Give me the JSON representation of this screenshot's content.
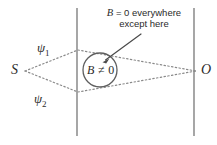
{
  "figure": {
    "kind": "aharonov-bohm-two-slit-diagram",
    "background_color": "#ffffff",
    "stroke_color": "#6e6e6e",
    "text_color": "#2b2b2b",
    "annotation": {
      "line1_symbol": "B",
      "line1_rest": " = 0 everywhere",
      "line2": "except here",
      "full_text": "B = 0 everywhere\nexcept here"
    },
    "labels": {
      "source": "S",
      "observation": "O",
      "path_upper_symbol": "ψ",
      "path_upper_subscript": "1",
      "path_lower_symbol": "ψ",
      "path_lower_subscript": "2",
      "field_region_symbol": "B",
      "field_region_relation": " ≠ 0"
    },
    "geometry": {
      "source_point": "(24, 71)",
      "observation_point": "(196, 71)",
      "upper_vertex": "(78, 50)",
      "lower_vertex": "(78, 92)",
      "solenoid_circle_center": "(100, 70)",
      "solenoid_circle_radius": "17",
      "barrier_left_x": "77",
      "barrier_right_x": "194",
      "barrier_top_y": "8",
      "barrier_bottom_y": "136",
      "arrow_tail": "(141, 34)",
      "arrow_head": "(103, 62)"
    }
  }
}
